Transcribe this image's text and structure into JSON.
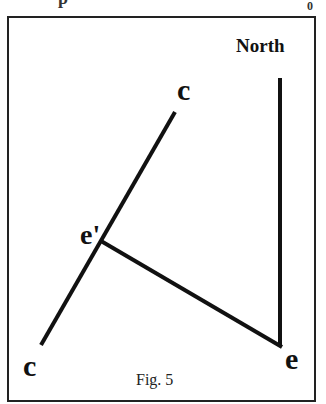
{
  "figure": {
    "caption": "Fig. 5",
    "top_cropped_text_fragments": [
      "p",
      "0"
    ],
    "frame": {
      "x1": 8,
      "y1": 17,
      "x2": 315,
      "y2": 401,
      "stroke": "#222222",
      "stroke_width": 2
    },
    "colors": {
      "line": "#111111",
      "background": "#ffffff"
    }
  },
  "labels": {
    "north": "North",
    "c_top": "c",
    "c_bottom": "c",
    "e_prime": "e'",
    "e": "e"
  },
  "geometry": {
    "line_cc": {
      "from": [
        41,
        345
      ],
      "to": [
        175,
        112
      ],
      "name": "c-c line"
    },
    "line_north": {
      "from": [
        280,
        78
      ],
      "to": [
        280,
        346
      ],
      "name": "north line"
    },
    "line_e_eprime": {
      "from": [
        280,
        346
      ],
      "to": [
        101,
        241
      ],
      "name": "e to e' line"
    },
    "points": {
      "e_prime": [
        101,
        241
      ],
      "e": [
        280,
        346
      ]
    },
    "line_width": 4
  }
}
